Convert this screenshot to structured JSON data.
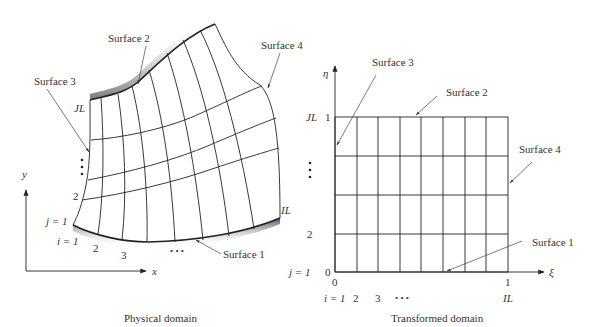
{
  "physical_domain": {
    "caption": "Physical domain",
    "axes": {
      "x_label": "x",
      "y_label": "y"
    },
    "surface_labels": {
      "surface1": "Surface 1",
      "surface2": "Surface 2",
      "surface3": "Surface 3",
      "surface4": "Surface 4"
    },
    "j_labels": {
      "j1": "j = 1",
      "j2": "2",
      "jl": "JL",
      "dots": "⋮"
    },
    "i_labels": {
      "i1": "i = 1",
      "i2": "2",
      "i3": "3",
      "dots": "• • •",
      "il": "IL"
    }
  },
  "transformed_domain": {
    "caption": "Transformed domain",
    "axes": {
      "xi_label": "ξ",
      "eta_label": "η"
    },
    "surface_labels": {
      "surface1": "Surface 1",
      "surface2": "Surface 2",
      "surface3": "Surface 3",
      "surface4": "Surface 4"
    },
    "eta_ticks": {
      "zero": "0",
      "one": "1"
    },
    "xi_ticks": {
      "zero": "0",
      "one": "1"
    },
    "j_labels": {
      "j1": "j = 1",
      "j2": "2",
      "jl": "JL",
      "dots": "⋮"
    },
    "i_labels": {
      "i1": "i = 1",
      "i2": "2",
      "i3": "3",
      "dots": "• • •",
      "il": "IL"
    },
    "grid": {
      "columns": 8,
      "rows": 4
    }
  }
}
